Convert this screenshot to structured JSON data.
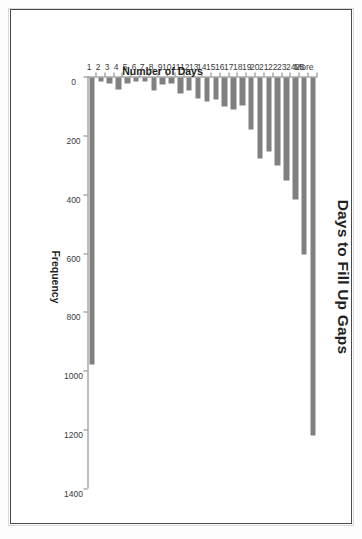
{
  "figure": {
    "border_color": "#4a4a4a",
    "background": "#ffffff"
  },
  "chart_data": {
    "type": "bar",
    "orientation": "vertical-rendered-rotated-90cw",
    "title": "Days to Fill Up Gaps",
    "xlabel": "Number of Days",
    "ylabel": "Frequency",
    "bar_color": "#808080",
    "grid": false,
    "legend": false,
    "ylim": [
      0,
      1400
    ],
    "ytick_values": [
      0,
      200,
      400,
      600,
      800,
      1000,
      1200,
      1400
    ],
    "ytick_labels": [
      "0",
      "200",
      "400",
      "600",
      "800",
      "1000",
      "1200",
      "1400"
    ],
    "categories": [
      "1",
      "2",
      "3",
      "4",
      "5",
      "6",
      "7",
      "8",
      "9",
      "10",
      "11",
      "12",
      "13",
      "14",
      "15",
      "16",
      "17",
      "18",
      "19",
      "20",
      "21",
      "22",
      "23",
      "24",
      "25",
      "More"
    ],
    "values": [
      1215,
      600,
      415,
      350,
      300,
      250,
      275,
      175,
      95,
      110,
      100,
      75,
      80,
      70,
      45,
      55,
      20,
      25,
      45,
      15,
      15,
      20,
      40,
      20,
      15,
      975
    ]
  }
}
